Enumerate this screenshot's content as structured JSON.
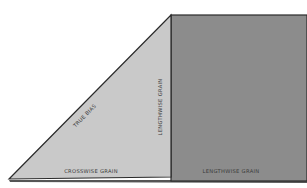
{
  "diagram": {
    "labels": {
      "true_bias": "TRUE BIAS",
      "lengthwise_grain_vertical": "LENGTHWISE GRAIN",
      "crosswise_grain": "CROSSWISE GRAIN",
      "lengthwise_grain_bottom": "LENGTHWISE GRAIN"
    },
    "colors": {
      "background": "#ffffff",
      "triangle_fill": "#c9c9c9",
      "rectangle_fill": "#8c8c8c",
      "outline": "#2a2a2a"
    }
  }
}
